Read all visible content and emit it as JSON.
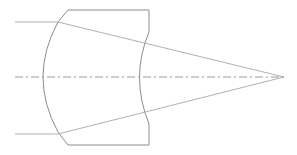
{
  "diagram": {
    "title": "",
    "colors": {
      "lens_outline": "#8c8c8c",
      "ray": "#a8a8a8",
      "axis": "#9a9a9a",
      "background": "#ffffff"
    },
    "optical_axis": {
      "y": 77,
      "x_start": 15,
      "x_end": 286,
      "style": "dash-dot"
    },
    "lens": {
      "top_edge_y": 10,
      "bottom_edge_y": 145,
      "top_left_x": 68,
      "right_x": 149,
      "left_surface": "convex",
      "right_surface": "concave",
      "left_vertex_x": 40,
      "right_vertex_x": 136
    },
    "rays": [
      {
        "start": [
          15,
          22
        ],
        "refract": [
          62,
          22
        ],
        "end": [
          284,
          77
        ]
      },
      {
        "start": [
          15,
          134
        ],
        "refract": [
          62,
          134
        ],
        "end": [
          284,
          77
        ]
      }
    ],
    "focal_point": [
      284,
      77
    ]
  }
}
